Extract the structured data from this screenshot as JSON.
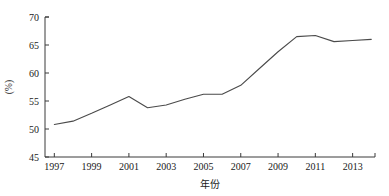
{
  "chart_data": {
    "type": "line",
    "title": "",
    "xlabel": "年份",
    "ylabel": "(%)",
    "xlim": [
      1996.5,
      2014.2
    ],
    "ylim": [
      45,
      70
    ],
    "grid": false,
    "legend": false,
    "y_ticks": [
      45,
      50,
      55,
      60,
      65,
      70
    ],
    "y_tick_labels": [
      "45",
      "50",
      "55",
      "60",
      "65",
      "70"
    ],
    "x_ticks": [
      1997,
      1999,
      2001,
      2003,
      2005,
      2007,
      2009,
      2011,
      2013
    ],
    "x_tick_labels": [
      "1997",
      "1999",
      "2001",
      "2003",
      "2005",
      "2007",
      "2009",
      "2011",
      "2013"
    ],
    "x": [
      1997,
      1998,
      1999,
      2000,
      2001,
      2002,
      2003,
      2004,
      2005,
      2006,
      2007,
      2008,
      2009,
      2010,
      2011,
      2012,
      2013,
      2014
    ],
    "series": [
      {
        "name": "",
        "color": "#4a4a4a",
        "values": [
          50.8,
          51.4,
          52.8,
          54.3,
          55.8,
          53.8,
          54.3,
          55.3,
          56.2,
          56.2,
          57.8,
          60.8,
          63.8,
          66.5,
          66.7,
          65.6,
          65.8,
          66.0
        ]
      }
    ]
  }
}
